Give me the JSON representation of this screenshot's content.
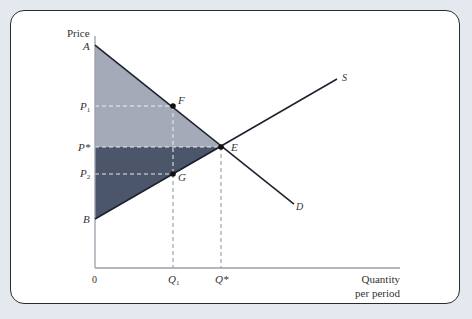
{
  "diagram": {
    "type": "supply-demand",
    "axes": {
      "y_label": "Price",
      "x_label_line1": "Quantity",
      "x_label_line2": "per period",
      "origin_label": "0"
    },
    "price_labels": {
      "A": "A",
      "P1": "P",
      "P1_sub": "1",
      "Pstar": "P*",
      "P2": "P",
      "P2_sub": "2",
      "B": "B"
    },
    "quantity_labels": {
      "Q1": "Q",
      "Q1_sub": "1",
      "Qstar": "Q*"
    },
    "point_labels": {
      "F": "F",
      "E": "E",
      "G": "G"
    },
    "curve_labels": {
      "supply": "S",
      "demand": "D"
    },
    "colors": {
      "background": "#e4e8ef",
      "upper_region": "#a4aab7",
      "lower_region": "#4c566b",
      "lines": "#1e2230",
      "dashes": "#e8ebf0"
    }
  }
}
